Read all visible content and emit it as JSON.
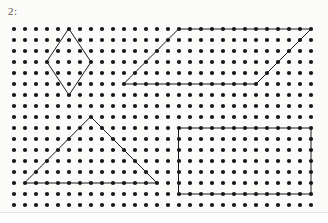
{
  "page": {
    "width": 328,
    "height": 223,
    "background_color": "#fbfbf9",
    "label": "2:",
    "label_color": "#55524d"
  },
  "geoboard": {
    "title": "dot-grid geoboard worksheet",
    "origin_x": 14,
    "origin_y": 29,
    "spacing": 11.0,
    "columns": 28,
    "rows": 17,
    "dot_radius": 2.1,
    "dot_color": "#17171a",
    "line_color": "#1a1a1d",
    "line_width": 1.0
  },
  "shapes": [
    {
      "name": "rhombus",
      "label": "diamond",
      "closed": true,
      "grid_points": [
        [
          5,
          0
        ],
        [
          7,
          3
        ],
        [
          5,
          6
        ],
        [
          3,
          3
        ]
      ]
    },
    {
      "name": "parallelogram",
      "label": "parallelogram",
      "closed": true,
      "grid_points": [
        [
          15,
          0
        ],
        [
          27,
          0
        ],
        [
          22,
          5
        ],
        [
          10,
          5
        ]
      ]
    },
    {
      "name": "triangle",
      "label": "triangle",
      "closed": true,
      "grid_points": [
        [
          7,
          8
        ],
        [
          13,
          14
        ],
        [
          1,
          14
        ]
      ]
    },
    {
      "name": "rectangle",
      "label": "rectangle",
      "closed": true,
      "grid_points": [
        [
          15,
          9
        ],
        [
          27,
          9
        ],
        [
          27,
          15
        ],
        [
          15,
          15
        ]
      ]
    }
  ],
  "chart_data": {
    "type": "scatter",
    "title": "",
    "xlabel": "",
    "ylabel": "",
    "grid": true,
    "legend": "none",
    "xlim": [
      0,
      27
    ],
    "ylim": [
      0,
      16
    ],
    "categories": [
      "rhombus",
      "parallelogram",
      "triangle",
      "rectangle"
    ],
    "values": [
      4,
      4,
      3,
      4
    ],
    "annotations": [
      "2:"
    ]
  }
}
